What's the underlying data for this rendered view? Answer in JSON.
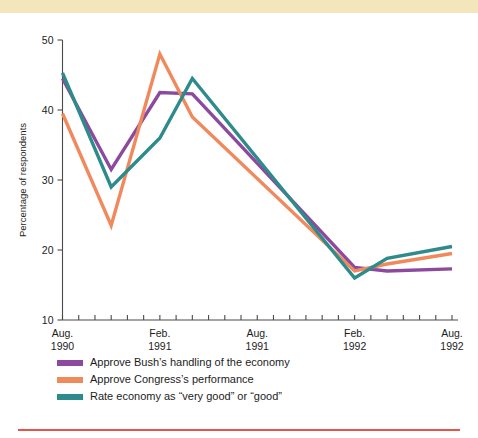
{
  "decor": {
    "top_band_color": "#f3e6bd",
    "bottom_rule_color": "#e8534a"
  },
  "legend": {
    "position": "below-axis-left",
    "entries": [
      {
        "label": "Approve Bush’s handling of the economy",
        "color": "#8c4a9e"
      },
      {
        "label": "Approve Congress’s performance",
        "color": "#f08a5d"
      },
      {
        "label": "Rate economy as “very good” or “good”",
        "color": "#2e8b8b"
      }
    ]
  },
  "chart_data": {
    "type": "line",
    "title": "",
    "subtitle": "",
    "xlabel": "",
    "ylabel": "Percentage of respondents",
    "ylim": [
      10,
      50
    ],
    "ytick_values": [
      10,
      20,
      30,
      40,
      50
    ],
    "ytick_labels": [
      "10",
      "20",
      "30",
      "40",
      "50"
    ],
    "grid": false,
    "x_minor_ticks_count": 25,
    "xtick_labeled": [
      {
        "index": 0,
        "line1": "Aug.",
        "line2": "1990"
      },
      {
        "index": 6,
        "line1": "Feb.",
        "line2": "1991"
      },
      {
        "index": 12,
        "line1": "Aug.",
        "line2": "1991"
      },
      {
        "index": 18,
        "line1": "Feb.",
        "line2": "1992"
      },
      {
        "index": 24,
        "line1": "Aug.",
        "line2": "1992"
      }
    ],
    "x": [
      "Aug. 1990",
      "Sep. 1990",
      "Oct. 1990",
      "Nov. 1990",
      "Dec. 1990",
      "Jan. 1991",
      "Feb. 1991",
      "Mar. 1991",
      "Apr. 1991",
      "May 1991",
      "Jun. 1991",
      "Jul. 1991",
      "Aug. 1991",
      "Sep. 1991",
      "Oct. 1991",
      "Nov. 1991",
      "Dec. 1991",
      "Jan. 1992",
      "Feb. 1992",
      "Mar. 1992",
      "Apr. 1992",
      "May 1992",
      "Jun. 1992",
      "Jul. 1992",
      "Aug. 1992"
    ],
    "series": [
      {
        "name": "Approve Bush’s handling of the economy",
        "color": "#8c4a9e",
        "points": [
          {
            "x": "Aug. 1990",
            "xi": 0,
            "y": 44.5
          },
          {
            "x": "Nov. 1990",
            "xi": 3,
            "y": 31.5
          },
          {
            "x": "Feb. 1991",
            "xi": 6,
            "y": 42.5
          },
          {
            "x": "Apr. 1991",
            "xi": 8,
            "y": 42.3
          },
          {
            "x": "Feb. 1992",
            "xi": 18,
            "y": 17.5
          },
          {
            "x": "Apr. 1992",
            "xi": 20,
            "y": 17.0
          },
          {
            "x": "Aug. 1992",
            "xi": 24,
            "y": 17.3
          }
        ]
      },
      {
        "name": "Approve Congress’s performance",
        "color": "#f08a5d",
        "points": [
          {
            "x": "Aug. 1990",
            "xi": 0,
            "y": 39.5
          },
          {
            "x": "Nov. 1990",
            "xi": 3,
            "y": 23.5
          },
          {
            "x": "Feb. 1991",
            "xi": 6,
            "y": 48.0
          },
          {
            "x": "Apr. 1991",
            "xi": 8,
            "y": 39.0
          },
          {
            "x": "Feb. 1992",
            "xi": 18,
            "y": 17.0
          },
          {
            "x": "Apr. 1992",
            "xi": 20,
            "y": 18.0
          },
          {
            "x": "Aug. 1992",
            "xi": 24,
            "y": 19.5
          }
        ]
      },
      {
        "name": "Rate economy as “very good” or “good”",
        "color": "#2e8b8b",
        "points": [
          {
            "x": "Aug. 1990",
            "xi": 0,
            "y": 45.3
          },
          {
            "x": "Nov. 1990",
            "xi": 3,
            "y": 29.0
          },
          {
            "x": "Feb. 1991",
            "xi": 6,
            "y": 36.0
          },
          {
            "x": "Apr. 1991",
            "xi": 8,
            "y": 44.5
          },
          {
            "x": "Feb. 1992",
            "xi": 18,
            "y": 16.0
          },
          {
            "x": "Apr. 1992",
            "xi": 20,
            "y": 18.8
          },
          {
            "x": "Aug. 1992",
            "xi": 24,
            "y": 20.5
          }
        ]
      }
    ]
  }
}
